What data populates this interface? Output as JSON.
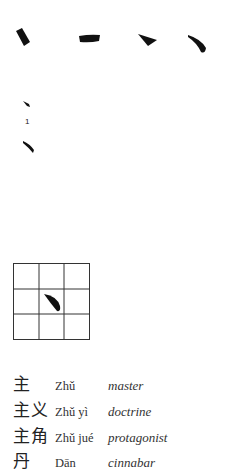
{
  "strokes_row": {
    "items": [
      {
        "name": "dot-stroke-tilted"
      },
      {
        "name": "horizontal-dot-stroke"
      },
      {
        "name": "triangular-dot-stroke"
      },
      {
        "name": "curved-dot-stroke"
      }
    ]
  },
  "stroke_order": {
    "step_label": "1"
  },
  "practice_grid": {
    "rows": 3,
    "cols": 3,
    "line_color": "#333333",
    "stroke_color": "#111111"
  },
  "vocabulary": [
    {
      "hanzi": "主",
      "pinyin": "Zhǔ",
      "meaning": "master"
    },
    {
      "hanzi": "主义",
      "pinyin": "Zhǔ yì",
      "meaning": "doctrine"
    },
    {
      "hanzi": "主角",
      "pinyin": "Zhǔ jué",
      "meaning": "protagonist"
    },
    {
      "hanzi": "丹",
      "pinyin": "Dān",
      "meaning": "cinnabar"
    }
  ]
}
